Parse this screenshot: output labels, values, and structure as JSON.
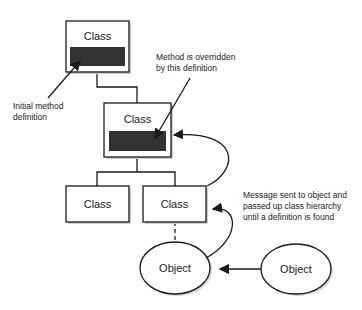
{
  "diagram": {
    "classes": [
      {
        "id": "root",
        "label": "Class",
        "has_method": true
      },
      {
        "id": "mid",
        "label": "Class",
        "has_method": true
      },
      {
        "id": "left",
        "label": "Class",
        "has_method": false
      },
      {
        "id": "right",
        "label": "Class",
        "has_method": false
      }
    ],
    "objects": [
      {
        "id": "obj1",
        "label": "Object"
      },
      {
        "id": "obj2",
        "label": "Object"
      }
    ],
    "annotations": {
      "initial": [
        "Initial method",
        "definition"
      ],
      "override": [
        "Method is overridden",
        "by this definition"
      ],
      "message": [
        "Message sent to object and",
        "passed up class hierarchy",
        "until a definition is found"
      ]
    },
    "colors": {
      "method_fill": "#333333",
      "stroke": "#1a1a1a",
      "shadow": "#c8c8c8"
    }
  }
}
